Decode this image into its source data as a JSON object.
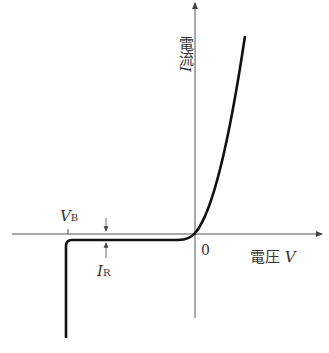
{
  "diagram": {
    "title": "",
    "y_axis": {
      "label": "電流",
      "symbol": "I"
    },
    "x_axis": {
      "label": "電圧",
      "symbol": "V"
    },
    "origin_label": "0",
    "breakdown_voltage": {
      "symbol": "V",
      "subscript": "B"
    },
    "reverse_current": {
      "symbol": "I",
      "subscript": "R"
    },
    "colors": {
      "curve": "#111111",
      "axis": "#555555",
      "text": "#333333"
    }
  }
}
